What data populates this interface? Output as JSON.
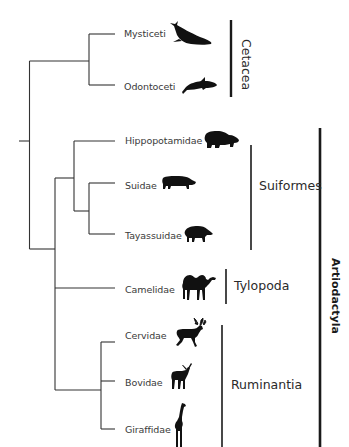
{
  "diagram": {
    "type": "phylogenetic-tree",
    "taxa": [
      {
        "name": "Mysticeti",
        "animal": "baleen-whale-icon"
      },
      {
        "name": "Odontoceti",
        "animal": "dolphin-icon"
      },
      {
        "name": "Hippopotamidae",
        "animal": "hippo-icon"
      },
      {
        "name": "Suidae",
        "animal": "pig-icon"
      },
      {
        "name": "Tayassuidae",
        "animal": "peccary-icon"
      },
      {
        "name": "Camelidae",
        "animal": "camel-icon"
      },
      {
        "name": "Cervidae",
        "animal": "reindeer-icon"
      },
      {
        "name": "Bovidae",
        "animal": "antelope-icon"
      },
      {
        "name": "Giraffidae",
        "animal": "giraffe-icon"
      }
    ],
    "clades": {
      "cetacea": "Cetacea",
      "suiformes": "Suiformes",
      "tylopoda": "Tylopoda",
      "ruminantia": "Ruminantia",
      "artiodactyla": "Artiodactyla"
    },
    "topology": "((Mysticeti,Odontoceti)Cetacea,((Hippopotamidae,(Suidae,Tayassuidae))Suiformes,Camelidae,(Cervidae,Bovidae,Giraffidae)Ruminantia))",
    "colors": {
      "line": "#333333",
      "bar": "#1a1a1a",
      "silhouette": "#111111",
      "text": "#3a3a3a"
    }
  }
}
